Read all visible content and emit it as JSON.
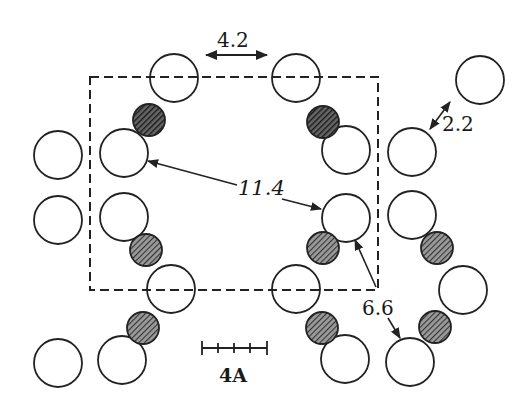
{
  "diagram": {
    "type": "molecular-packing-cross-section",
    "colors": {
      "stroke": "#222222",
      "open_fill": "#ffffff",
      "hatched_fill": "#555555",
      "background": "#ffffff"
    },
    "unit_cell": {
      "x": 90,
      "y": 77,
      "width": 288,
      "height": 213,
      "style": "dashed"
    },
    "open_circles": [
      {
        "cx": 174,
        "cy": 78
      },
      {
        "cx": 296,
        "cy": 78
      },
      {
        "cx": 480,
        "cy": 80
      },
      {
        "cx": 58,
        "cy": 155
      },
      {
        "cx": 124,
        "cy": 153
      },
      {
        "cx": 346,
        "cy": 150
      },
      {
        "cx": 412,
        "cy": 152
      },
      {
        "cx": 58,
        "cy": 220
      },
      {
        "cx": 124,
        "cy": 217
      },
      {
        "cx": 346,
        "cy": 218
      },
      {
        "cx": 412,
        "cy": 215
      },
      {
        "cx": 171,
        "cy": 289
      },
      {
        "cx": 296,
        "cy": 289
      },
      {
        "cx": 463,
        "cy": 290
      },
      {
        "cx": 58,
        "cy": 363
      },
      {
        "cx": 122,
        "cy": 360
      },
      {
        "cx": 345,
        "cy": 359
      },
      {
        "cx": 410,
        "cy": 362
      }
    ],
    "open_radius": 24,
    "hatched_circles": [
      {
        "cx": 149,
        "cy": 120,
        "dark": true
      },
      {
        "cx": 323,
        "cy": 122,
        "dark": true
      },
      {
        "cx": 146,
        "cy": 250
      },
      {
        "cx": 323,
        "cy": 248
      },
      {
        "cx": 437,
        "cy": 248
      },
      {
        "cx": 143,
        "cy": 328
      },
      {
        "cx": 322,
        "cy": 328
      },
      {
        "cx": 435,
        "cy": 327
      }
    ],
    "hatched_radius": 16,
    "distances": [
      {
        "label": "4.2",
        "meaning": "horizontal spacing between top circles"
      },
      {
        "label": "2.2",
        "meaning": "contact distance top-right pair"
      },
      {
        "label": "11.4",
        "meaning": "diagonal across unit cell"
      },
      {
        "label": "6.6",
        "meaning": "distance to neighbouring chain"
      }
    ],
    "scale_bar": {
      "label": "4A",
      "ticks": 5
    }
  }
}
